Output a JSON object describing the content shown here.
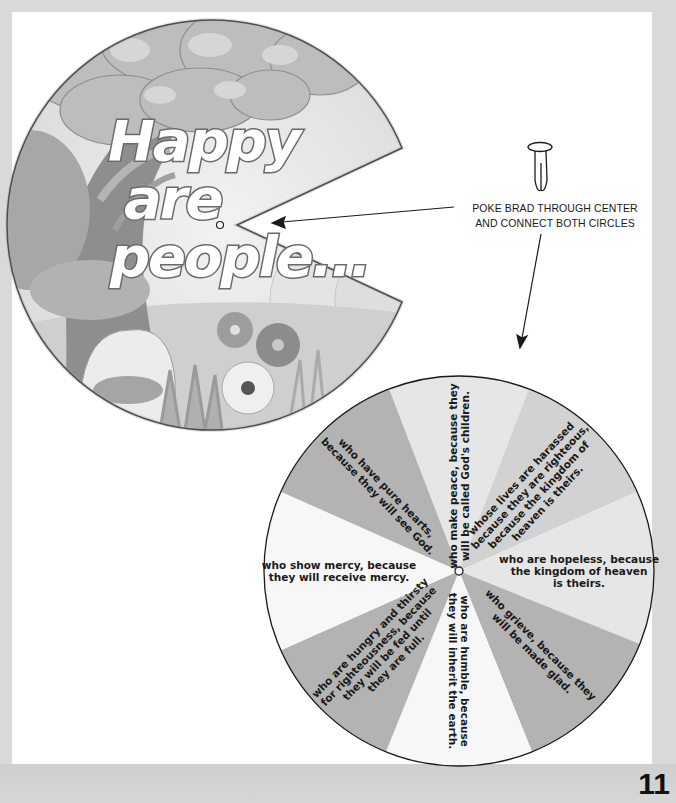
{
  "page": {
    "page_number": "11",
    "background_color": "#d9d9d9",
    "page_color": "#ffffff"
  },
  "top_circle": {
    "title_lines": [
      "Happy",
      "are",
      "people..."
    ],
    "scene_description": "tree with leafy canopy, bushes and flowers",
    "has_wedge_cutout": true,
    "center_hole": true
  },
  "instruction": {
    "lines": [
      "POKE BRAD THROUGH CENTER",
      "AND CONNECT BOTH CIRCLES"
    ],
    "icon": "brad-fastener-icon"
  },
  "bottom_wheel": {
    "colors": {
      "light": "#e6e6e6",
      "medium": "#d2d2d2",
      "dark": "#b3b3b3",
      "white": "#f7f7f7"
    },
    "segments": [
      {
        "id": "peace",
        "lines": [
          "who make peace, because they",
          "will be called God's children."
        ]
      },
      {
        "id": "harassed",
        "lines": [
          "whose lives are harassed",
          "because they are righteous,",
          "because the kingdom of",
          "heaven is theirs."
        ]
      },
      {
        "id": "hopeless",
        "lines": [
          "who are hopeless, because",
          "the kingdom of heaven",
          "is theirs."
        ]
      },
      {
        "id": "grieve",
        "lines": [
          "who grieve, because they",
          "will be made glad."
        ]
      },
      {
        "id": "humble",
        "lines": [
          "who are humble, because",
          "they will inherit the earth."
        ]
      },
      {
        "id": "hungry",
        "lines": [
          "who are hungry and thirsty",
          "for righteousness, because",
          "they will be fed until",
          "they are full."
        ]
      },
      {
        "id": "mercy",
        "lines": [
          "who show mercy, because",
          "they will receive mercy."
        ]
      },
      {
        "id": "pure",
        "lines": [
          "who have pure hearts,",
          "because they will see God."
        ]
      }
    ]
  }
}
